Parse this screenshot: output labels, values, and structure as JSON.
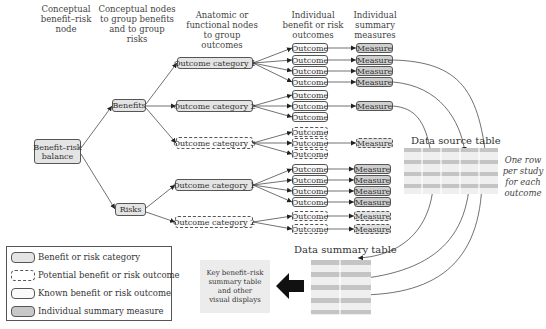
{
  "headers": {
    "col1": [
      "Conceptual",
      "benefit–risk",
      "node"
    ],
    "col2": [
      "Conceptual nodes",
      "to group benefits",
      "and to group risks"
    ],
    "col3": [
      "Anatomic or",
      "functional nodes",
      "to group outcomes"
    ],
    "col4": [
      "Individual",
      "benefit or risk",
      "outcomes"
    ],
    "col5": [
      "Individual",
      "summary",
      "measures"
    ]
  },
  "root": {
    "label_line1": "Benefit–risk",
    "label_line2": "balance"
  },
  "groups": {
    "benefits": "Benefits",
    "risks": "Risks"
  },
  "categories": {
    "benefit_cat1": "Outcome category 1",
    "benefit_cat2": "Outcome category 2",
    "benefit_cat3": "Outcome category 3",
    "risk_cat1": "Outcome category 1",
    "risk_cat2": "Outcome category 2"
  },
  "outcome_label": "Outcome",
  "measure_label": "Measure",
  "data_source_table": {
    "title": "Data source table",
    "note": [
      "One row",
      "per study",
      "for each",
      "outcome"
    ]
  },
  "data_summary_table": {
    "title": "Data summary table"
  },
  "key_box": [
    "Key benefit–risk",
    "summary table",
    "and other",
    "visual displays"
  ],
  "legend": {
    "items": [
      {
        "style": "category",
        "label": "Benefit or risk category"
      },
      {
        "style": "potential",
        "label": "Potential benefit or risk outcome"
      },
      {
        "style": "known",
        "label": "Known benefit or risk outcome"
      },
      {
        "style": "measure",
        "label": "Individual summary measure"
      }
    ]
  },
  "colors": {
    "category_fill": "#e4e4e4",
    "measure_fill": "#cfcfcf",
    "outline": "#555555",
    "table_band_dark": "#c8c8c8",
    "table_band_light": "#ebebeb",
    "arrow_black": "#111111"
  }
}
